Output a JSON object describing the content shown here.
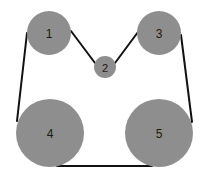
{
  "diagram": {
    "type": "belt-pulley",
    "colors": {
      "background": "#ffffff",
      "pulley_fill": "#8e8e8e",
      "belt": "#111111",
      "label": "#1a1a1a"
    },
    "pulleys": [
      {
        "label": "1",
        "cx": 49,
        "cy": 33,
        "r": 22
      },
      {
        "label": "2",
        "cx": 105,
        "cy": 67,
        "r": 11
      },
      {
        "label": "3",
        "cx": 159,
        "cy": 33,
        "r": 22
      },
      {
        "label": "4",
        "cx": 50,
        "cy": 133,
        "r": 34
      },
      {
        "label": "5",
        "cx": 159,
        "cy": 133,
        "r": 34
      }
    ],
    "belt_segments": [
      {
        "from": "1",
        "to": "4",
        "x1": 27,
        "y1": 33,
        "x2": 17,
        "y2": 121
      },
      {
        "from": "1",
        "to": "2",
        "x1": 71,
        "y1": 31,
        "x2": 95,
        "y2": 63
      },
      {
        "from": "2",
        "to": "3",
        "x1": 115,
        "y1": 63,
        "x2": 138,
        "y2": 32
      },
      {
        "from": "3",
        "to": "5",
        "x1": 181,
        "y1": 35,
        "x2": 192,
        "y2": 122
      },
      {
        "from": "4",
        "to": "5",
        "x1": 57,
        "y1": 166,
        "x2": 152,
        "y2": 166
      }
    ]
  }
}
